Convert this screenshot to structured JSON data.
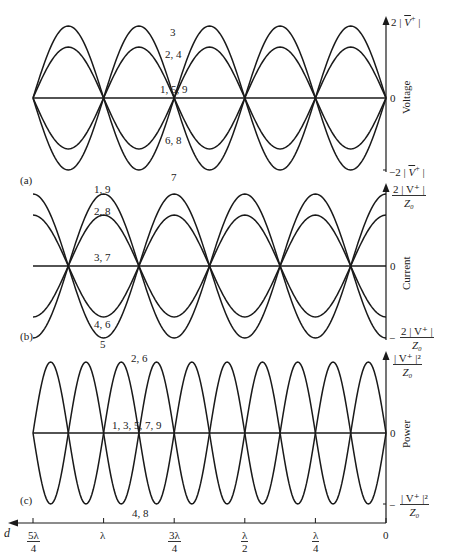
{
  "chart_data": {
    "type": "line",
    "title": "",
    "xlabel": "d",
    "x_direction": "right-to-left",
    "x_ticks": [
      "5λ/4",
      "λ",
      "3λ/4",
      "λ/2",
      "λ/4",
      "0"
    ],
    "x_range_wavelengths": [
      0,
      1.25
    ],
    "grid": false,
    "legend": "inline curve-number labels",
    "panels": [
      {
        "tag": "(a)",
        "ylabel": "Voltage",
        "y_ticks": [
          "2 |V⁺|",
          "0",
          "−2 |V⁺|"
        ],
        "ylim_normalized": [
          -1,
          1
        ],
        "description": "Standing wave voltage snapshots at successive instants; nulls at d = λ/4... actually zeros at 0, λ/2, λ",
        "curves": [
          {
            "labels": "3",
            "amplitude": 1.0,
            "shape": "cos(2βd)",
            "sign": 1
          },
          {
            "labels": "2, 4",
            "amplitude": 0.707,
            "shape": "cos",
            "sign": 1
          },
          {
            "labels": "1, 5, 9",
            "amplitude": 0.0,
            "shape": "flat",
            "sign": 1
          },
          {
            "labels": "6, 8",
            "amplitude": 0.707,
            "shape": "cos",
            "sign": -1
          },
          {
            "labels": "7",
            "amplitude": 1.0,
            "shape": "cos",
            "sign": -1
          }
        ],
        "zero_crossings": [
          "0",
          "λ/2",
          "λ"
        ],
        "extrema_at": [
          "λ/4",
          "3λ/4",
          "5λ/4"
        ]
      },
      {
        "tag": "(b)",
        "ylabel": "Current",
        "y_ticks": [
          "2 |V⁺| / Z₀",
          "0",
          "− 2 |V⁺| / Z₀"
        ],
        "ylim_normalized": [
          -1,
          1
        ],
        "curves": [
          {
            "labels": "1, 9",
            "amplitude": 1.0,
            "sign": 1
          },
          {
            "labels": "2, 8",
            "amplitude": 0.707,
            "sign": 1
          },
          {
            "labels": "3, 7",
            "amplitude": 0.0,
            "sign": 1
          },
          {
            "labels": "4, 6",
            "amplitude": 0.707,
            "sign": -1
          },
          {
            "labels": "5",
            "amplitude": 1.0,
            "sign": -1
          }
        ],
        "zero_crossings": [
          "λ/4",
          "3λ/4",
          "5λ/4"
        ],
        "extrema_at": [
          "0",
          "λ/2",
          "λ"
        ]
      },
      {
        "tag": "(c)",
        "ylabel": "Power",
        "y_ticks": [
          "|V⁺|² / Z₀",
          "0",
          "− |V⁺|² / Z₀"
        ],
        "ylim_normalized": [
          -1,
          1
        ],
        "curves": [
          {
            "labels": "2, 6",
            "amplitude": 1.0,
            "sign": 1
          },
          {
            "labels": "1, 3, 5, 7, 9",
            "amplitude": 0.0,
            "sign": 1
          },
          {
            "labels": "4, 8",
            "amplitude": 1.0,
            "sign": -1
          }
        ],
        "zero_crossings": [
          "0",
          "λ/4",
          "λ/2",
          "3λ/4",
          "λ",
          "5λ/4"
        ],
        "extrema_at": [
          "λ/8",
          "3λ/8",
          "5λ/8",
          "7λ/8",
          "9λ/8"
        ]
      }
    ]
  },
  "labels": {
    "panel_a": {
      "tag": "(a)",
      "ylabel": "Voltage",
      "y_top": "2 | ",
      "y_top_sym": "V",
      "y_top_sup": "+",
      "y_top_end": " |",
      "y_zero": "0",
      "y_bot": "−2 | ",
      "y_bot_sym": "V",
      "y_bot_sup": "+",
      "y_bot_end": " |",
      "curve_3": "3",
      "curve_2_4": "2, 4",
      "curve_1_5_9": "1, 5, 9",
      "curve_6_8": "6, 8",
      "curve_7": "7"
    },
    "panel_b": {
      "tag": "(b)",
      "ylabel": "Current",
      "y_top_num": "2 | V⁺ |",
      "y_top_den": "Z₀",
      "y_zero": "0",
      "y_bot_sign": "−",
      "y_bot_num": "2 | V⁺ |",
      "y_bot_den": "Z₀",
      "curve_1_9": "1, 9",
      "curve_2_8": "2, 8",
      "curve_3_7": "3, 7",
      "curve_4_6": "4, 6",
      "curve_5": "5"
    },
    "panel_c": {
      "tag": "(c)",
      "ylabel": "Power",
      "y_top_num": "| V⁺ |²",
      "y_top_den": "Z₀",
      "y_zero": "0",
      "y_bot_sign": "−",
      "y_bot_num": "| V⁺ |²",
      "y_bot_den": "Z₀",
      "curve_2_6": "2, 6",
      "curve_1_3_5_7_9": "1, 3, 5, 7, 9",
      "curve_4_8": "4, 8"
    },
    "x_axis": {
      "var": "d",
      "t0_num": "5λ",
      "t0_den": "4",
      "t1": "λ",
      "t2_num": "3λ",
      "t2_den": "4",
      "t3_num": "λ",
      "t3_den": "2",
      "t4_num": "λ",
      "t4_den": "4",
      "t5": "0"
    }
  },
  "colors": {
    "ink": "#1a1a1a",
    "background": "#ffffff"
  }
}
